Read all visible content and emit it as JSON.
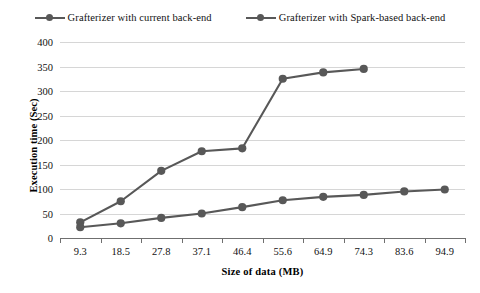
{
  "chart_data": {
    "type": "line",
    "title": "",
    "xlabel": "Size of data (MB)",
    "ylabel": "Execution time (Sec)",
    "categories": [
      "9.3",
      "18.5",
      "27.8",
      "37.1",
      "46.4",
      "55.6",
      "64.9",
      "74.3",
      "83.6",
      "94.9"
    ],
    "xtick_labels": [
      "9.3",
      "18.5",
      "27.8",
      "37.1",
      "46.4",
      "55.6",
      "64.9",
      "74.3",
      "83.6",
      "94.9"
    ],
    "ytick_labels": [
      "0",
      "50",
      "100",
      "150",
      "200",
      "250",
      "300",
      "350",
      "400"
    ],
    "ylim": [
      0,
      400
    ],
    "ytick_step": 50,
    "grid": true,
    "legend_position": "top-center",
    "series": [
      {
        "name": "Grafterizer with current back-end",
        "color": "#585858",
        "values": [
          32,
          75,
          137,
          177,
          183,
          325,
          338,
          345,
          null,
          null
        ]
      },
      {
        "name": "Grafterizer with Spark-based back-end",
        "color": "#585858",
        "values": [
          22,
          30,
          41,
          50,
          63,
          77,
          84,
          88,
          95,
          99
        ]
      }
    ]
  },
  "legend": {
    "entries": [
      {
        "label": "Grafterizer with current back-end"
      },
      {
        "label": "Grafterizer with Spark-based back-end"
      }
    ]
  },
  "axes": {
    "y_title": "Execution time (Sec)",
    "x_title": "Size of data (MB)"
  },
  "colors": {
    "series_line": "#585858",
    "grid": "#d6d6d6",
    "axis": "#6f6f6f",
    "text": "#111111",
    "background": "#ffffff"
  }
}
